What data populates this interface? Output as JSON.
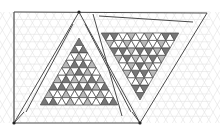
{
  "diagram": {
    "type": "geometric-tessellation",
    "width": 220,
    "height": 133,
    "colors": {
      "background": "#ffffff",
      "outline": "#4a4a4a",
      "grid": "#e2e2e2",
      "dark": "#777777",
      "light": "#b8b8b8",
      "white": "#ffffff"
    },
    "outline_points": {
      "top_left": [
        14,
        12
      ],
      "apex": [
        79,
        12
      ],
      "top_right": [
        207,
        13
      ],
      "bottom_left": [
        14,
        123
      ],
      "bottom_right": [
        140,
        123
      ]
    },
    "left_pattern": {
      "orientation": "up",
      "apex": [
        79,
        38
      ],
      "side": 8.6,
      "rows": 9,
      "shading": [
        "D",
        "DD",
        "WLW",
        "LDDL",
        "WLDLW",
        "LDLLDL",
        "DDLDDLD",
        "LWLWLWLW",
        "DDWLWLWDD"
      ]
    },
    "right_pattern": {
      "orientation": "down",
      "apex": [
        140,
        100
      ],
      "side": 8.6,
      "rows": 9,
      "shading": [
        "D",
        "DD",
        "WLW",
        "LDDL",
        "WLDLW",
        "LDLLDL",
        "DDLDDLD",
        "LWLWLWLW",
        "DDWLWLWDD"
      ]
    }
  }
}
